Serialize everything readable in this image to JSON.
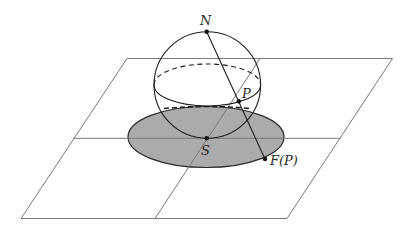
{
  "figure": {
    "labels": {
      "north_pole": "N",
      "point_on_sphere": "P",
      "south_pole": "S",
      "projected_point": "F(P)"
    },
    "colors": {
      "disk_fill": "#ababab",
      "plane_lines": "#7a7a7a",
      "outline": "#1e1e1e"
    }
  }
}
